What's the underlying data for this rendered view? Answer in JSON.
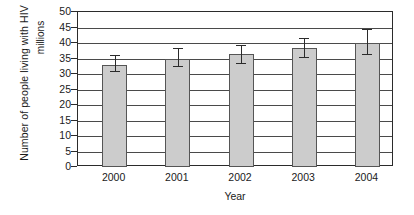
{
  "chart_data": {
    "type": "bar",
    "title": "",
    "xlabel": "Year",
    "ylabel": "Number of people living with HIV",
    "yunits": "millions",
    "categories": [
      "2000",
      "2001",
      "2002",
      "2003",
      "2004"
    ],
    "values": [
      33,
      35,
      36.5,
      38.5,
      40
    ],
    "series": [
      {
        "name": "Number of people living with HIV",
        "values": [
          33,
          35,
          36.5,
          38.5,
          40
        ],
        "error_low": [
          31,
          32.5,
          33.5,
          35.5,
          36.5
        ],
        "error_high": [
          36,
          38.5,
          39.5,
          41.5,
          44.5
        ]
      }
    ],
    "ylim": [
      0,
      50
    ],
    "yticks": [
      0,
      5,
      10,
      15,
      20,
      25,
      30,
      35,
      40,
      45,
      50
    ],
    "ytick_labels": [
      "0",
      "5",
      "10",
      "15",
      "20",
      "25",
      "30",
      "35",
      "40",
      "45",
      "50"
    ],
    "grid": true,
    "legend": false,
    "bar_color": "#cccccc",
    "bar_edge_color": "#555555",
    "error_bar_color": "#2b2b2b",
    "axis_color": "#2b2b2b",
    "grid_color": "#4a4a4a",
    "background": "#ffffff"
  }
}
